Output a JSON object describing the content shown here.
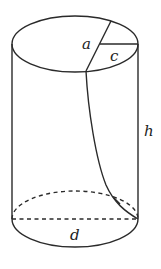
{
  "diagram": {
    "type": "cylinder-with-helical-cut",
    "labels": {
      "a": "a",
      "c": "c",
      "h": "h",
      "d": "d"
    },
    "colors": {
      "line": "#2a2a2a",
      "background": "#ffffff"
    }
  }
}
